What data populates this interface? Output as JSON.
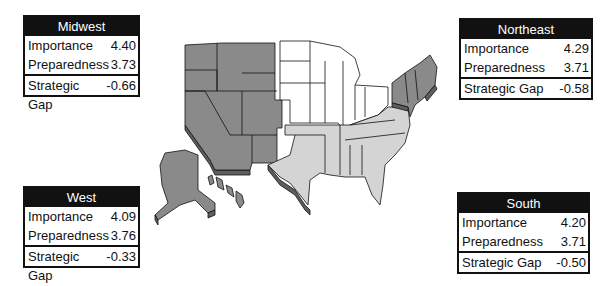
{
  "regions": {
    "midwest": {
      "name": "Midwest",
      "importance_label": "Importance",
      "importance": "4.40",
      "preparedness_label": "Preparedness",
      "preparedness": "3.73",
      "gap_label": "Strategic Gap",
      "gap": "-0.66"
    },
    "northeast": {
      "name": "Northeast",
      "importance_label": "Importance",
      "importance": "4.29",
      "preparedness_label": "Preparedness",
      "preparedness": "3.71",
      "gap_label": "Strategic Gap",
      "gap": "-0.58"
    },
    "west": {
      "name": "West",
      "importance_label": "Importance",
      "importance": "4.09",
      "preparedness_label": "Preparedness",
      "preparedness": "3.76",
      "gap_label": "Strategic Gap",
      "gap": "-0.33"
    },
    "south": {
      "name": "South",
      "importance_label": "Importance",
      "importance": "4.20",
      "preparedness_label": "Preparedness",
      "preparedness": "3.71",
      "gap_label": "Strategic Gap",
      "gap": "-0.50"
    }
  },
  "colors": {
    "west_fill": "#8a8a8a",
    "northeast_fill": "#8a8a8a",
    "midwest_fill": "#ffffff",
    "south_fill": "#d4d4d4",
    "extrusion": "#5e5e5e",
    "outline": "#111111"
  }
}
